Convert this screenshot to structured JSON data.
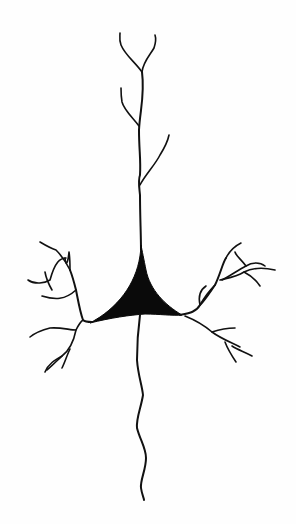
{
  "image": {
    "subject": "pyramidal-neuron-line-drawing",
    "background_color": "#ffffff",
    "ink_color": "#111111",
    "parts": [
      {
        "name": "apical-dendrite"
      },
      {
        "name": "soma"
      },
      {
        "name": "basal-dendrites-left"
      },
      {
        "name": "basal-dendrites-right"
      },
      {
        "name": "axon"
      }
    ]
  }
}
